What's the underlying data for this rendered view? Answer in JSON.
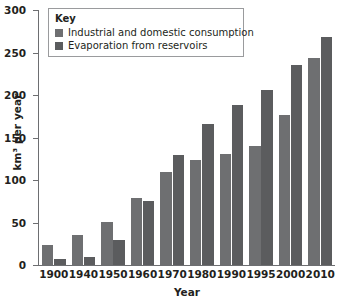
{
  "chart_data": {
    "type": "bar",
    "title": "",
    "subtitle": "",
    "xlabel": "Year",
    "ylabel": "km³ per year",
    "categories": [
      "1900",
      "1940",
      "1950",
      "1960",
      "1970",
      "1980",
      "1990",
      "1995",
      "2000",
      "2010"
    ],
    "series": [
      {
        "name": "Industrial and domestic consumption",
        "color": "#6e6f71",
        "values": [
          24,
          35,
          51,
          79,
          109,
          123,
          131,
          140,
          177,
          243
        ]
      },
      {
        "name": "Evaporation from reservoirs",
        "color": "#5b5c5e",
        "values": [
          7,
          10,
          30,
          75,
          130,
          166,
          188,
          206,
          235,
          268
        ]
      }
    ],
    "ylim": [
      0,
      300
    ],
    "yticks": [
      0,
      50,
      100,
      150,
      200,
      250,
      300
    ],
    "ytick_labels": [
      "0",
      "50",
      "100",
      "150",
      "200",
      "250",
      "300"
    ],
    "grid": false,
    "legend_position": "top-left",
    "legend_title": "Key"
  },
  "legend": {
    "title": "Key",
    "entries": [
      {
        "label": "Industrial and domestic consumption",
        "swatch_name": "legend-swatch-industrial"
      },
      {
        "label": "Evaporation from reservoirs",
        "swatch_name": "legend-swatch-evaporation"
      }
    ]
  },
  "axes": {
    "y_title": "km³ per year",
    "x_title": "Year"
  }
}
